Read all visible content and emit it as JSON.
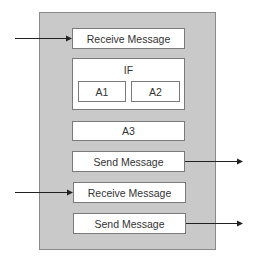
{
  "diagram": {
    "type": "process-activity",
    "container": {
      "fill": "#c9c9c9",
      "border": "#8a8a8a"
    },
    "steps": [
      {
        "id": "receive1",
        "label": "Receive Message",
        "incoming_arrow": true
      },
      {
        "id": "if",
        "label": "IF",
        "branches": [
          {
            "label": "A1"
          },
          {
            "label": "A2"
          }
        ]
      },
      {
        "id": "a3",
        "label": "A3"
      },
      {
        "id": "send1",
        "label": "Send Message",
        "outgoing_arrow": true
      },
      {
        "id": "receive2",
        "label": "Receive Message",
        "incoming_arrow": true
      },
      {
        "id": "send2",
        "label": "Send Message",
        "outgoing_arrow": true
      }
    ],
    "arrow_color": "#222222"
  }
}
